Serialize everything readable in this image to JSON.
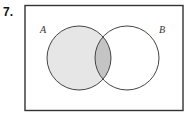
{
  "problem": {
    "number": "7."
  },
  "diagram": {
    "type": "venn",
    "sets": [
      {
        "label": "A",
        "shaded": true
      },
      {
        "label": "B",
        "shaded": false
      }
    ],
    "intersection_shaded": true,
    "colors": {
      "border": "#333333",
      "a_fill": "#e6e6e6",
      "intersection_fill": "#c4c4c4"
    }
  }
}
